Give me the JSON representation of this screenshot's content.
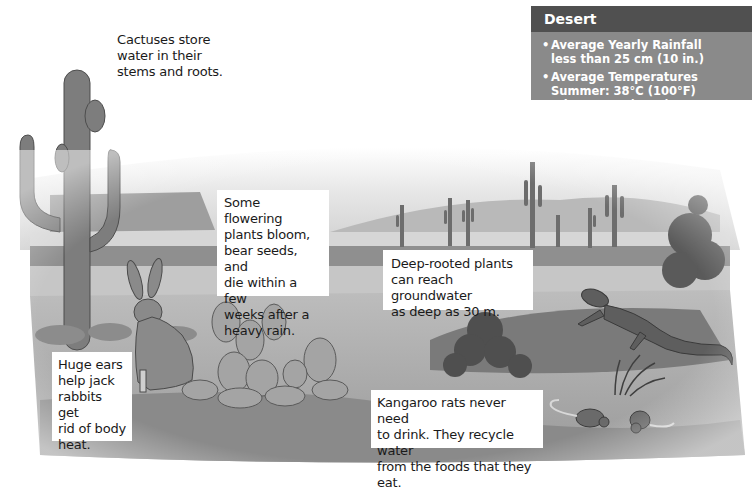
{
  "info_box": {
    "title": "Desert",
    "items": [
      {
        "heading": "Average Yearly Rainfall",
        "lines": [
          "less than 25 cm (10 in.)"
        ]
      },
      {
        "heading": "Average Temperatures",
        "lines": [
          "Summer: 38°C (100°F)",
          "Winter: 7°C (45°F)"
        ]
      }
    ],
    "colors": {
      "header_bg": "#505050",
      "body_bg": "#8a8a8a",
      "text": "#ffffff"
    }
  },
  "captions": {
    "cactus": [
      "Cactuses store",
      "water in their",
      "stems and roots."
    ],
    "flowering_plants": [
      "Some flowering",
      "plants bloom,",
      "bear seeds, and",
      "die within a few",
      "weeks after a",
      "heavy rain."
    ],
    "deep_rooted": [
      "Deep-rooted plants",
      "can reach groundwater",
      "as deep as 30 m."
    ],
    "jack_rabbit": [
      "Huge ears",
      "help jack",
      "rabbits get",
      "rid of body",
      "heat."
    ],
    "kangaroo_rat": [
      "Kangaroo rats never need",
      "to drink. They recycle water",
      "from the foods that they eat."
    ]
  },
  "illustration": {
    "subjects": [
      "saguaro-cactus",
      "distant-mesa",
      "distant-saguaros",
      "jack-rabbit",
      "prickly-pear-cactus",
      "shrub",
      "lizard",
      "kangaroo-rats",
      "grass-tuft"
    ],
    "palette": "grayscale"
  }
}
